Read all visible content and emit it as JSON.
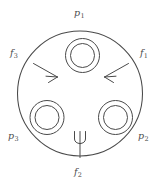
{
  "figure": {
    "name": "pair-of-pants-surface-diagram",
    "background_color": "#ffffff",
    "stroke_color": "#4a4a4a",
    "label_color": "#4a4a4a"
  },
  "labels": {
    "p1": {
      "base": "p",
      "sub": "1"
    },
    "p2": {
      "base": "p",
      "sub": "2"
    },
    "p3": {
      "base": "p",
      "sub": "3"
    },
    "f1": {
      "base": "f",
      "sub": "1"
    },
    "f2": {
      "base": "f",
      "sub": "2"
    },
    "f3": {
      "base": "f",
      "sub": "3"
    }
  },
  "glyphs": {
    "psi": "ψ"
  },
  "shapes": {
    "outer_boundary": {
      "name": "outer-circle",
      "cx": 80,
      "cy": 93.5,
      "r": 62.5
    },
    "holes": [
      {
        "name": "hole-top",
        "cx": 82.5,
        "cy": 55.5,
        "r_outer": 17.0,
        "r_inner": 12.0
      },
      {
        "name": "hole-bottom-left",
        "cx": 47.0,
        "cy": 117.5,
        "r_outer": 17.0,
        "r_inner": 12.0
      },
      {
        "name": "hole-bottom-right",
        "cx": 115.5,
        "cy": 117.5,
        "r_outer": 17.0,
        "r_inner": 12.0
      }
    ],
    "arrows": [
      {
        "name": "arrow-left",
        "direction": "left"
      },
      {
        "name": "arrow-right",
        "direction": "right"
      }
    ]
  }
}
